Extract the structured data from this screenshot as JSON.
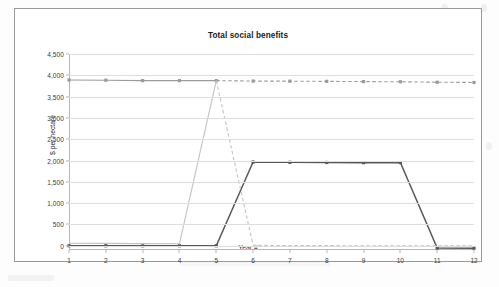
{
  "chart_data": {
    "type": "line",
    "title": "Total social benefits",
    "xlabel": "Year #",
    "ylabel": "$ per hectare",
    "categories": [
      "1",
      "2",
      "3",
      "4",
      "5",
      "6",
      "7",
      "8",
      "9",
      "10",
      "11",
      "12"
    ],
    "x": [
      1,
      2,
      3,
      4,
      5,
      6,
      7,
      8,
      9,
      10,
      11,
      12
    ],
    "ylim": [
      -100,
      4500
    ],
    "yticks": [
      "0",
      "500",
      "1,000",
      "1,500",
      "2,000",
      "2,500",
      "3,000",
      "3,500",
      "4,000",
      "4,500"
    ],
    "ytick_values": [
      0,
      500,
      1000,
      1500,
      2000,
      2500,
      3000,
      3500,
      4000,
      4500
    ],
    "grid": true,
    "legend": "none",
    "series": [
      {
        "name": "upper-constant-benefits",
        "color": "#9a9a9e",
        "style": "solid-then-dashed",
        "marker": "square",
        "values": [
          3890,
          3885,
          3875,
          3875,
          3875,
          3865,
          3862,
          3858,
          3852,
          3848,
          3838,
          3832
        ]
      },
      {
        "name": "stepped-benefits",
        "color": "#585858",
        "style": "solid",
        "marker": "square",
        "values": [
          0,
          0,
          0,
          0,
          0,
          1965,
          1958,
          1955,
          1950,
          1952,
          -55,
          -58
        ]
      },
      {
        "name": "declining-benefits",
        "color": "#c3c3c6",
        "style": "solid-then-dashed",
        "marker": "none",
        "values": [
          60,
          55,
          50,
          48,
          3875,
          10,
          5,
          2,
          0,
          0,
          0,
          0
        ]
      }
    ]
  }
}
